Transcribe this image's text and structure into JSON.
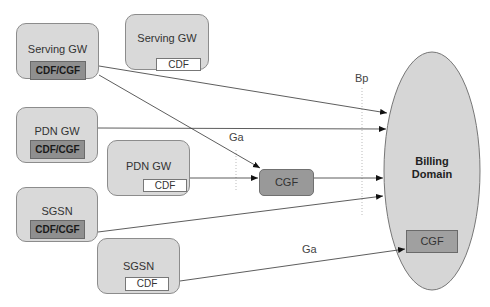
{
  "nodes": {
    "sgw1": {
      "title": "Serving GW",
      "function": "CDF/CGF"
    },
    "sgw2": {
      "title": "Serving GW",
      "function": "CDF"
    },
    "pgw1": {
      "title": "PDN GW",
      "function": "CDF/CGF"
    },
    "pgw2": {
      "title": "PDN GW",
      "function": "CDF"
    },
    "sgsn1": {
      "title": "SGSN",
      "function": "CDF/CGF"
    },
    "sgsn2": {
      "title": "SGSN",
      "function": "CDF"
    },
    "cgf_mid": {
      "title": "CGF"
    }
  },
  "billing_domain": {
    "line1": "Billing",
    "line2": "Domain",
    "cgf": "CGF"
  },
  "interfaces": {
    "ga_upper": "Ga",
    "ga_lower": "Ga",
    "bp": "Bp"
  },
  "colors": {
    "node_fill": "#d9d9d9",
    "cgf_fill": "#8f8f8f",
    "ellipse_fill": "#d6d6d6"
  }
}
